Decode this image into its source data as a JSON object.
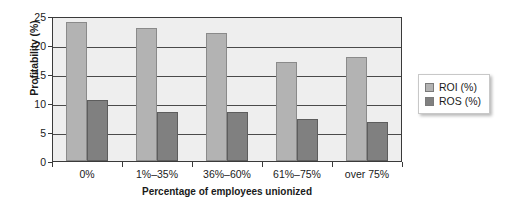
{
  "chart_data": {
    "type": "bar",
    "title": "",
    "xlabel": "Percentage of employees unionized",
    "ylabel": "Profitability (%)",
    "categories": [
      "0%",
      "1%–35%",
      "36%–60%",
      "61%–75%",
      "over 75%"
    ],
    "series": [
      {
        "name": "ROI (%)",
        "color": "#b3b3b3",
        "values": [
          24,
          23,
          22,
          17,
          18
        ]
      },
      {
        "name": "ROS (%)",
        "color": "#808080",
        "values": [
          10.5,
          8.5,
          8.4,
          7.3,
          6.8
        ]
      }
    ],
    "ylim": [
      0,
      25
    ],
    "yticks": [
      0,
      5,
      10,
      15,
      20,
      25
    ],
    "ytick_labels": [
      "0",
      "5",
      "10",
      "15",
      "20",
      "25"
    ],
    "grid": true,
    "grid_axis": "y",
    "legend_position": "right",
    "plot_background": "#eeeeee",
    "axis_color": "#3a3a3a"
  },
  "legend": {
    "items": [
      {
        "label": "ROI (%)"
      },
      {
        "label": "ROS (%)"
      }
    ]
  }
}
